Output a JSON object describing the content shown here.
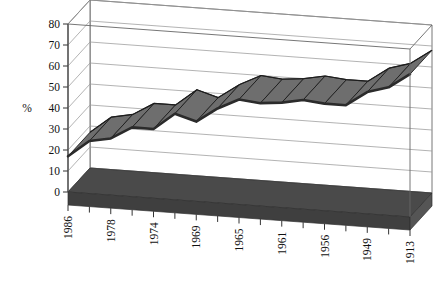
{
  "chart_data": {
    "type": "line",
    "style": "3d-ribbon",
    "title": "",
    "subtitle": "",
    "xlabel": "",
    "ylabel": "%",
    "ylim": [
      0,
      80
    ],
    "y_ticks": [
      "0",
      "10",
      "20",
      "30",
      "40",
      "50",
      "60",
      "70",
      "80"
    ],
    "y_tick_values": [
      0,
      10,
      20,
      30,
      40,
      50,
      60,
      70,
      80
    ],
    "grid": true,
    "legend": false,
    "legend_position": "none",
    "x_tick_rotation": -90,
    "categories": [
      "1986",
      "",
      "1978",
      "",
      "1974",
      "",
      "1969",
      "",
      "1965",
      "",
      "1961",
      "",
      "1956",
      "",
      "1949",
      "",
      "1913"
    ],
    "x_tick_labels": [
      "1986",
      "1978",
      "1974",
      "1969",
      "1965",
      "1961",
      "1956",
      "1949",
      "1913"
    ],
    "values": [
      17,
      25,
      27,
      33,
      33,
      41,
      38,
      45,
      50,
      49,
      50,
      52,
      51,
      51,
      58,
      61,
      68
    ],
    "series": [
      {
        "name": "percent",
        "values": [
          17,
          25,
          27,
          33,
          33,
          41,
          38,
          45,
          50,
          49,
          50,
          52,
          51,
          51,
          58,
          61,
          68
        ]
      }
    ],
    "colors": {
      "ribbon_top": "#6e6e6e",
      "ribbon_side": "#2b2b2b",
      "floor": "#4a4a4a",
      "grid": "#9a9a9a",
      "axis": "#666666",
      "text": "#111111",
      "background": "#ffffff"
    }
  }
}
